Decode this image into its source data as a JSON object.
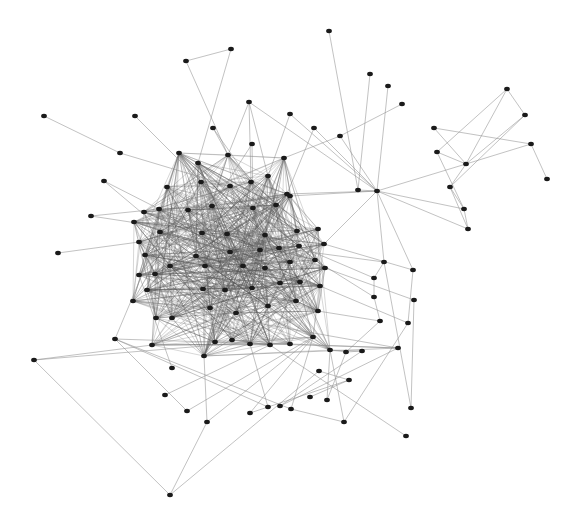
{
  "graph": {
    "type": "network",
    "node_color": "#1a1a1a",
    "edge_color": "#8a8a8a",
    "node_radius": 2.6,
    "nodes": [
      [
        329,
        31
      ],
      [
        231,
        49
      ],
      [
        186,
        61
      ],
      [
        370,
        74
      ],
      [
        388,
        86
      ],
      [
        402,
        104
      ],
      [
        507,
        89
      ],
      [
        525,
        115
      ],
      [
        44,
        116
      ],
      [
        135,
        116
      ],
      [
        249,
        102
      ],
      [
        290,
        114
      ],
      [
        213,
        128
      ],
      [
        340,
        136
      ],
      [
        434,
        128
      ],
      [
        531,
        144
      ],
      [
        120,
        153
      ],
      [
        179,
        153
      ],
      [
        252,
        144
      ],
      [
        314,
        128
      ],
      [
        437,
        152
      ],
      [
        466,
        164
      ],
      [
        547,
        179
      ],
      [
        228,
        155
      ],
      [
        198,
        163
      ],
      [
        284,
        158
      ],
      [
        377,
        191
      ],
      [
        450,
        187
      ],
      [
        358,
        190
      ],
      [
        464,
        209
      ],
      [
        468,
        229
      ],
      [
        104,
        181
      ],
      [
        167,
        187
      ],
      [
        201,
        182
      ],
      [
        230,
        186
      ],
      [
        268,
        176
      ],
      [
        276,
        205
      ],
      [
        251,
        182
      ],
      [
        287,
        194
      ],
      [
        91,
        216
      ],
      [
        144,
        212
      ],
      [
        159,
        209
      ],
      [
        134,
        222
      ],
      [
        188,
        210
      ],
      [
        212,
        206
      ],
      [
        253,
        208
      ],
      [
        290,
        196
      ],
      [
        160,
        232
      ],
      [
        202,
        233
      ],
      [
        227,
        234
      ],
      [
        265,
        235
      ],
      [
        297,
        231
      ],
      [
        318,
        229
      ],
      [
        58,
        253
      ],
      [
        139,
        242
      ],
      [
        145,
        255
      ],
      [
        196,
        256
      ],
      [
        230,
        252
      ],
      [
        260,
        250
      ],
      [
        279,
        248
      ],
      [
        299,
        246
      ],
      [
        324,
        244
      ],
      [
        155,
        274
      ],
      [
        170,
        266
      ],
      [
        205,
        266
      ],
      [
        243,
        266
      ],
      [
        265,
        268
      ],
      [
        290,
        262
      ],
      [
        315,
        260
      ],
      [
        325,
        268
      ],
      [
        139,
        275
      ],
      [
        147,
        290
      ],
      [
        203,
        289
      ],
      [
        225,
        290
      ],
      [
        252,
        288
      ],
      [
        280,
        283
      ],
      [
        300,
        282
      ],
      [
        320,
        286
      ],
      [
        133,
        301
      ],
      [
        172,
        318
      ],
      [
        156,
        318
      ],
      [
        210,
        308
      ],
      [
        236,
        313
      ],
      [
        268,
        306
      ],
      [
        296,
        301
      ],
      [
        318,
        311
      ],
      [
        152,
        345
      ],
      [
        215,
        342
      ],
      [
        232,
        340
      ],
      [
        250,
        344
      ],
      [
        270,
        345
      ],
      [
        290,
        344
      ],
      [
        313,
        337
      ],
      [
        330,
        350
      ],
      [
        384,
        262
      ],
      [
        374,
        278
      ],
      [
        413,
        270
      ],
      [
        374,
        297
      ],
      [
        414,
        300
      ],
      [
        408,
        323
      ],
      [
        380,
        321
      ],
      [
        346,
        352
      ],
      [
        362,
        351
      ],
      [
        398,
        348
      ],
      [
        115,
        339
      ],
      [
        34,
        360
      ],
      [
        172,
        368
      ],
      [
        204,
        356
      ],
      [
        319,
        371
      ],
      [
        349,
        380
      ],
      [
        165,
        395
      ],
      [
        187,
        411
      ],
      [
        207,
        422
      ],
      [
        250,
        413
      ],
      [
        268,
        407
      ],
      [
        280,
        406
      ],
      [
        291,
        409
      ],
      [
        327,
        400
      ],
      [
        344,
        422
      ],
      [
        411,
        408
      ],
      [
        406,
        436
      ],
      [
        310,
        397
      ],
      [
        170,
        495
      ]
    ],
    "edges": [
      [
        0,
        28
      ],
      [
        1,
        2
      ],
      [
        1,
        24
      ],
      [
        2,
        23
      ],
      [
        3,
        28
      ],
      [
        4,
        26
      ],
      [
        5,
        13
      ],
      [
        6,
        7
      ],
      [
        6,
        20
      ],
      [
        6,
        21
      ],
      [
        7,
        21
      ],
      [
        7,
        27
      ],
      [
        15,
        21
      ],
      [
        15,
        22
      ],
      [
        14,
        21
      ],
      [
        14,
        15
      ],
      [
        20,
        29
      ],
      [
        20,
        21
      ],
      [
        21,
        26
      ],
      [
        21,
        27
      ],
      [
        27,
        29
      ],
      [
        29,
        30
      ],
      [
        27,
        30
      ],
      [
        26,
        30
      ],
      [
        26,
        29
      ],
      [
        26,
        28
      ],
      [
        26,
        13
      ],
      [
        26,
        19
      ],
      [
        26,
        10
      ],
      [
        26,
        38
      ],
      [
        26,
        46
      ],
      [
        26,
        61
      ],
      [
        26,
        94
      ],
      [
        26,
        96
      ],
      [
        13,
        25
      ],
      [
        11,
        26
      ],
      [
        8,
        16
      ],
      [
        16,
        34
      ],
      [
        9,
        33
      ],
      [
        17,
        33
      ],
      [
        17,
        44
      ],
      [
        12,
        23
      ],
      [
        12,
        37
      ],
      [
        10,
        37
      ],
      [
        10,
        35
      ],
      [
        10,
        23
      ],
      [
        11,
        35
      ],
      [
        19,
        38
      ],
      [
        18,
        45
      ],
      [
        18,
        44
      ],
      [
        23,
        36
      ],
      [
        24,
        44
      ],
      [
        25,
        36
      ],
      [
        31,
        41
      ],
      [
        32,
        45
      ],
      [
        39,
        41
      ],
      [
        39,
        48
      ],
      [
        40,
        49
      ],
      [
        42,
        57
      ],
      [
        53,
        54
      ],
      [
        54,
        58
      ],
      [
        55,
        63
      ],
      [
        31,
        64
      ],
      [
        32,
        58
      ],
      [
        33,
        58
      ],
      [
        34,
        59
      ],
      [
        35,
        60
      ],
      [
        78,
        103
      ],
      [
        103,
        104
      ],
      [
        103,
        107
      ],
      [
        104,
        47
      ],
      [
        103,
        115
      ],
      [
        107,
        57
      ],
      [
        106,
        70
      ],
      [
        62,
        87
      ],
      [
        80,
        71
      ],
      [
        108,
        109
      ],
      [
        109,
        113
      ],
      [
        107,
        112
      ],
      [
        105,
        86
      ],
      [
        105,
        92
      ],
      [
        111,
        92
      ],
      [
        112,
        92
      ],
      [
        113,
        92
      ],
      [
        114,
        89
      ],
      [
        116,
        92
      ],
      [
        118,
        93
      ],
      [
        119,
        94
      ],
      [
        117,
        93
      ],
      [
        121,
        109
      ],
      [
        120,
        90
      ],
      [
        110,
        90
      ],
      [
        122,
        112
      ],
      [
        122,
        105
      ],
      [
        122,
        108
      ],
      [
        94,
        59
      ],
      [
        95,
        60
      ],
      [
        96,
        61
      ],
      [
        97,
        68
      ],
      [
        98,
        69
      ],
      [
        99,
        77
      ],
      [
        100,
        85
      ],
      [
        101,
        93
      ],
      [
        102,
        93
      ],
      [
        94,
        95
      ],
      [
        95,
        97
      ],
      [
        97,
        100
      ],
      [
        96,
        99
      ],
      [
        100,
        101
      ],
      [
        101,
        102
      ],
      [
        116,
        104
      ],
      [
        117,
        101
      ],
      [
        116,
        118
      ],
      [
        118,
        99
      ],
      [
        119,
        98
      ],
      [
        115,
        102
      ],
      [
        114,
        104
      ],
      [
        111,
        104
      ],
      [
        91,
        103
      ]
    ],
    "core_bounds": {
      "x": [
        125,
        345
      ],
      "y": [
        145,
        360
      ]
    },
    "core_edge_count": 900
  }
}
